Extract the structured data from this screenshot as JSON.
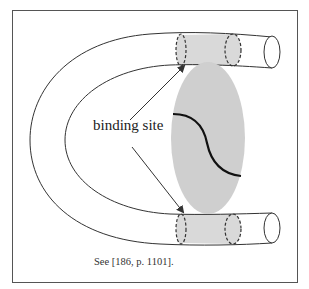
{
  "figure": {
    "label": "binding site",
    "caption": "See [186, p. 1101].",
    "colors": {
      "frame": "#555555",
      "tube_stroke": "#333333",
      "binding_region_fill": "#d9d9d9",
      "molecule_fill": "#cfcfcf",
      "curve": "#111111",
      "arrow": "#333333"
    },
    "elements": [
      "U-shaped tube",
      "top binding region (shaded, dashed)",
      "bottom binding region (shaded, dashed)",
      "gray ellipse molecule with S-curve",
      "two arrows from label to binding regions"
    ]
  }
}
